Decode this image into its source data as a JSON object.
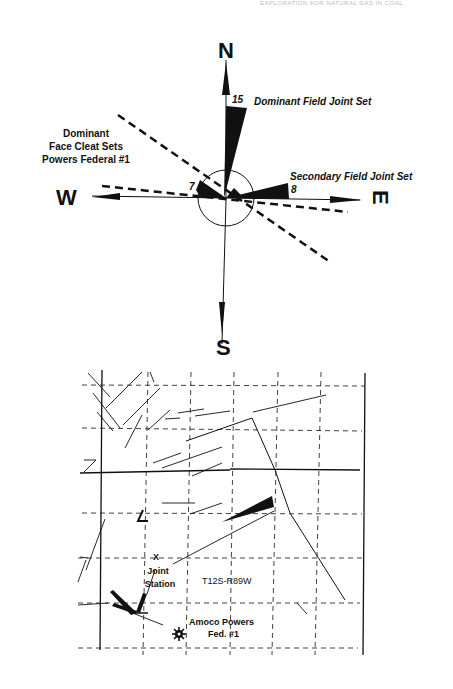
{
  "header": {
    "text": "EXPLORATION FOR NATURAL GAS IN COAL"
  },
  "rose_diagram": {
    "compass": {
      "north": "N",
      "south": "S",
      "east": "E",
      "west": "W"
    },
    "labels": {
      "dominant_field": "Dominant Field Joint Set",
      "secondary_field": "Secondary Field Joint Set",
      "face_cleat_line1": "Dominant",
      "face_cleat_line2": "Face Cleat Sets",
      "face_cleat_line3": "Powers Federal #1"
    },
    "counts": {
      "dominant": "15",
      "secondary": "8",
      "west_petal": "7"
    }
  },
  "map": {
    "township_range": "T12S-R89W",
    "joint_station_marker": "X",
    "joint_station_line1": "Joint",
    "joint_station_line2": "Station",
    "well_line1": "Amoco Powers",
    "well_line2": "Fed. #1",
    "well_symbol": "gas-well-icon"
  },
  "colors": {
    "ink": "#111111",
    "paper": "#ffffff"
  }
}
